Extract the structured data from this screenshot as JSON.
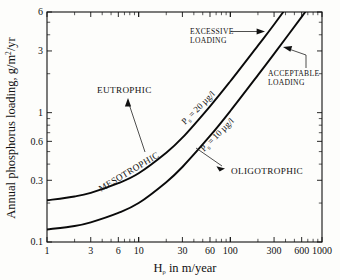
{
  "chart_data": {
    "type": "line",
    "title": "",
    "xlabel": "Hρ in m/year",
    "ylabel": "Annual phosphorus loading, g/m²/yr",
    "xscale": "log",
    "yscale": "log",
    "xlim": [
      1,
      1000
    ],
    "ylim": [
      0.1,
      6
    ],
    "grid": false,
    "legend_position": "inline-annotations",
    "xticks": [
      1,
      3,
      6,
      10,
      30,
      60,
      100,
      300,
      600,
      1000
    ],
    "xticklabels": [
      "1",
      "3",
      "6",
      "10",
      "30",
      "60",
      "100",
      "300",
      "600",
      "1000"
    ],
    "yticks": [
      0.1,
      0.3,
      0.6,
      1,
      3,
      6
    ],
    "yticklabels": [
      "0.1",
      "0.3",
      "0.6",
      "1",
      "3",
      "6"
    ],
    "series": [
      {
        "name": "P = 20 µg/l",
        "label": "P",
        "label_subscript": "s",
        "label_rest": " = 20 µg/l",
        "x": [
          1,
          2,
          3,
          6,
          10,
          20,
          30,
          60,
          100,
          200,
          300,
          600,
          1000
        ],
        "y": [
          0.21,
          0.225,
          0.24,
          0.285,
          0.34,
          0.49,
          0.64,
          1.12,
          1.75,
          3.3,
          4.8,
          9.4,
          15.4
        ]
      },
      {
        "name": "P = 10 µg/l",
        "label": "P",
        "label_subscript": "s",
        "label_rest": " = 10 µg/l",
        "x": [
          1,
          2,
          3,
          6,
          10,
          20,
          30,
          60,
          100,
          200,
          300,
          600,
          1000
        ],
        "y": [
          0.125,
          0.133,
          0.142,
          0.168,
          0.2,
          0.29,
          0.38,
          0.66,
          1.03,
          1.95,
          2.85,
          5.5,
          9.1
        ]
      }
    ],
    "annotations": [
      {
        "text": "EUTROPHIC",
        "x": 4.2,
        "y": 1.25,
        "kind": "zone"
      },
      {
        "text": "MESOTROPHIC",
        "x": 9.5,
        "y": 0.225,
        "kind": "zone",
        "rotated": true
      },
      {
        "text": "OLIGOTROPHIC",
        "x": 135,
        "y": 0.3,
        "kind": "zone"
      },
      {
        "text_line1": "EXCESSIVE",
        "text_line2": "LOADING",
        "x": 40,
        "y": 3.4,
        "kind": "note"
      },
      {
        "text_line1": "ACCEPTABLE",
        "text_line2": "LOADING",
        "x": 330,
        "y": 1.35,
        "kind": "note"
      }
    ]
  },
  "labels": {
    "y_axis_title_main": "Annual phosphorus loading, g/m",
    "y_axis_title_sup": "2",
    "y_axis_title_tail": "/yr",
    "x_axis_title_h": "H",
    "x_axis_title_rho": "ρ",
    "x_axis_title_rest": " in m/year",
    "eutrophic": "EUTROPHIC",
    "mesotrophic": "MESOTROPHIC",
    "oligotrophic": "OLIGOTROPHIC",
    "excessive_line1": "EXCESSIVE",
    "excessive_line2": "LOADING",
    "acceptable_line1": "ACCEPTABLE",
    "acceptable_line2": "LOADING",
    "curve_upper_p": "P",
    "curve_upper_sub": "s",
    "curve_upper_rest": " = 20 µg/l",
    "curve_lower_p": "P",
    "curve_lower_sub": "s",
    "curve_lower_rest": " = 10 µg/l"
  },
  "xticklabels": [
    "1",
    "3",
    "6",
    "10",
    "30",
    "60",
    "100",
    "300",
    "600",
    "1000"
  ],
  "yticklabels": [
    "0.1",
    "0.3",
    "0.6",
    "1",
    "3",
    "6"
  ],
  "colors": {
    "background": "#fdfdfb",
    "axis": "#111111",
    "curve": "#0a0a0a"
  }
}
